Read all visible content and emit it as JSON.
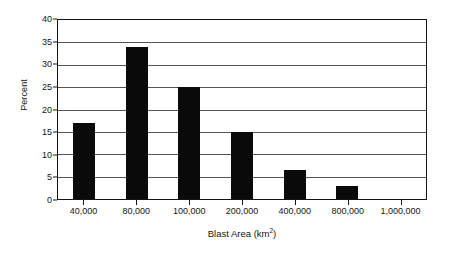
{
  "chart_data": {
    "type": "bar",
    "title": "",
    "subtitle": "",
    "xlabel": "Blast Area (km",
    "xlabel_sup": "2",
    "xlabel_suffix": ")",
    "xlabel_full": "Blast Area (km2)",
    "ylabel": "Percent",
    "categories": [
      "40,000",
      "80,000",
      "100,000",
      "200,000",
      "400,000",
      "800,000",
      "1,000,000"
    ],
    "values": [
      17,
      34,
      25,
      15,
      6.5,
      2.8,
      0
    ],
    "ylim": [
      0,
      40
    ],
    "yticks": [
      0,
      5,
      10,
      15,
      20,
      25,
      30,
      35,
      40
    ],
    "ytick_labels": [
      "0",
      "5",
      "10",
      "15",
      "20",
      "25",
      "30",
      "35",
      "40"
    ],
    "grid": true,
    "grid_axis": "y",
    "legend": false,
    "legend_position": "none",
    "bar_color": "#0a0a0a",
    "background_color": "#ffffff",
    "axis_color": "#141414",
    "gridline_color": "#555555"
  }
}
